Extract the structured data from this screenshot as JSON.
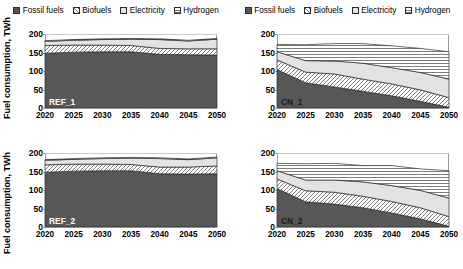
{
  "legend": {
    "items": [
      {
        "label": "Fossil fuels",
        "key": "fossil-swatch"
      },
      {
        "label": "Biofuels",
        "key": "biofuels-swatch"
      },
      {
        "label": "Electricity",
        "key": "electricity-swatch"
      },
      {
        "label": "Hydrogen",
        "key": "hydrogen-swatch"
      }
    ]
  },
  "axis": {
    "ylabel": "Fuel consumption, TWh",
    "yticks": [
      0,
      50,
      100,
      150,
      200
    ],
    "xticks": [
      2020,
      2025,
      2030,
      2035,
      2040,
      2045,
      2050
    ],
    "ylim": [
      0,
      200
    ],
    "xlim": [
      2020,
      2050
    ]
  },
  "colors": {
    "fossil": "#575757",
    "biofuels": "#ffffff",
    "electricity": "#e3e3e3",
    "hydrogen": "#ffffff",
    "hatch": "#6e6e6e",
    "outline": "#2b2b2b",
    "gridline": "#c9c9c9",
    "frame": "#9a9a9a"
  },
  "chart_data": [
    {
      "type": "area",
      "title": "REF_1",
      "stacked": true,
      "xlabel": "",
      "ylabel": "Fuel consumption, TWh",
      "ylim": [
        0,
        200
      ],
      "grid": true,
      "legend_position": "top-center",
      "x": [
        2020,
        2025,
        2030,
        2035,
        2040,
        2045,
        2050
      ],
      "series": [
        {
          "name": "Fossil fuels",
          "values": [
            148,
            151,
            152,
            152,
            145,
            144,
            143
          ]
        },
        {
          "name": "Biofuels",
          "values": [
            21,
            19,
            18,
            17,
            16,
            16,
            17
          ]
        },
        {
          "name": "Electricity",
          "values": [
            11,
            13,
            15,
            17,
            24,
            21,
            26
          ]
        },
        {
          "name": "Hydrogen",
          "values": [
            2,
            2,
            2,
            2,
            2,
            2,
            2
          ]
        }
      ],
      "totals": [
        182,
        185,
        187,
        188,
        187,
        183,
        188
      ]
    },
    {
      "type": "area",
      "title": "CN_1",
      "stacked": true,
      "xlabel": "",
      "ylabel": "Fuel consumption, TWh",
      "ylim": [
        0,
        200
      ],
      "grid": true,
      "legend_position": "top-center",
      "x": [
        2020,
        2025,
        2030,
        2035,
        2040,
        2045,
        2050
      ],
      "series": [
        {
          "name": "Fossil fuels",
          "values": [
            104,
            68,
            57,
            45,
            33,
            18,
            2
          ]
        },
        {
          "name": "Biofuels",
          "values": [
            26,
            29,
            35,
            33,
            32,
            31,
            26
          ]
        },
        {
          "name": "Electricity",
          "values": [
            22,
            31,
            35,
            43,
            44,
            47,
            50
          ]
        },
        {
          "name": "Hydrogen",
          "values": [
            20,
            43,
            47,
            53,
            59,
            65,
            74
          ]
        }
      ],
      "totals": [
        172,
        171,
        174,
        174,
        168,
        161,
        152
      ]
    },
    {
      "type": "area",
      "title": "REF_2",
      "stacked": true,
      "xlabel": "",
      "ylabel": "Fuel consumption, TWh",
      "ylim": [
        0,
        200
      ],
      "grid": true,
      "legend_position": "top-center",
      "x": [
        2020,
        2025,
        2030,
        2035,
        2040,
        2045,
        2050
      ],
      "series": [
        {
          "name": "Fossil fuels",
          "values": [
            148,
            151,
            152,
            152,
            144,
            143,
            144
          ]
        },
        {
          "name": "Biofuels",
          "values": [
            20,
            19,
            18,
            17,
            18,
            19,
            21
          ]
        },
        {
          "name": "Electricity",
          "values": [
            12,
            13,
            15,
            17,
            23,
            20,
            22
          ]
        },
        {
          "name": "Hydrogen",
          "values": [
            2,
            2,
            2,
            2,
            2,
            2,
            2
          ]
        }
      ],
      "totals": [
        182,
        185,
        187,
        188,
        187,
        184,
        189
      ]
    },
    {
      "type": "area",
      "title": "CN_2",
      "stacked": true,
      "xlabel": "",
      "ylabel": "Fuel consumption, TWh",
      "ylim": [
        0,
        200
      ],
      "grid": true,
      "legend_position": "top-center",
      "x": [
        2020,
        2025,
        2030,
        2035,
        2040,
        2045,
        2050
      ],
      "series": [
        {
          "name": "Fossil fuels",
          "values": [
            104,
            68,
            62,
            52,
            38,
            22,
            2
          ]
        },
        {
          "name": "Biofuels",
          "values": [
            26,
            30,
            32,
            31,
            31,
            30,
            26
          ]
        },
        {
          "name": "Electricity",
          "values": [
            22,
            29,
            33,
            39,
            43,
            47,
            50
          ]
        },
        {
          "name": "Hydrogen",
          "values": [
            20,
            44,
            45,
            44,
            54,
            58,
            74
          ]
        }
      ],
      "totals": [
        172,
        171,
        172,
        166,
        166,
        157,
        152
      ]
    }
  ]
}
